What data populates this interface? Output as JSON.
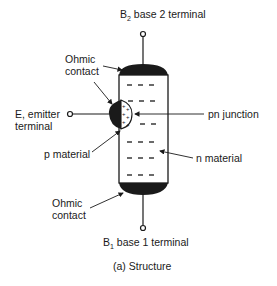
{
  "labels": {
    "b2": {
      "prefix": "B",
      "sub": "2",
      "text": " base 2 terminal"
    },
    "ohmic_top_1": "Ohmic",
    "ohmic_top_2": "contact",
    "emitter_1": "E, emitter",
    "emitter_2": "terminal",
    "pn_junction": "pn junction",
    "p_material": "p material",
    "n_material": "n material",
    "ohmic_bot_1": "Ohmic",
    "ohmic_bot_2": "contact",
    "b1": {
      "prefix": "B",
      "sub": "1",
      "text": " base 1 terminal"
    },
    "caption": "(a) Structure"
  },
  "colors": {
    "ink": "#1a1a1a",
    "background": "#ffffff"
  }
}
